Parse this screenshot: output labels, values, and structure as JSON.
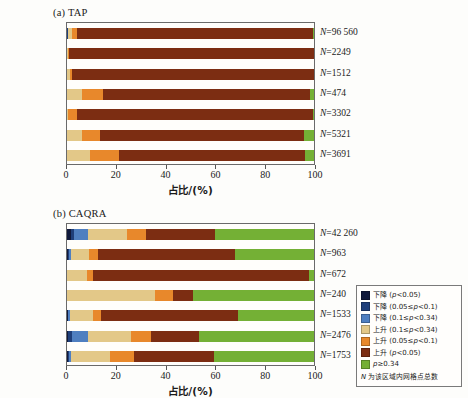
{
  "figure": {
    "axis_title": "占比/(%)",
    "xticks": [
      0,
      20,
      40,
      60,
      80,
      100
    ],
    "xlim": [
      0,
      100
    ]
  },
  "panel_a": {
    "title": "(a) TAP"
  },
  "panel_b": {
    "title": "(b) CAQRA"
  },
  "legend": {
    "items": [
      {
        "label": "下降 (p<0.05)",
        "color": "#10193b"
      },
      {
        "label": "下降 (0.05≤p<0.1)",
        "color": "#1f3f7a"
      },
      {
        "label": "下降 (0.1≤p<0.34)",
        "color": "#4f7fc0"
      },
      {
        "label": "上升 (0.1≤p<0.34)",
        "color": "#e3c888"
      },
      {
        "label": "上升 (0.05≤p<0.1)",
        "color": "#e8882b"
      },
      {
        "label": "上升 (p<0.05)",
        "color": "#7c2d12"
      },
      {
        "label": "p≥0.34",
        "color": "#74b035"
      }
    ],
    "note": "N 为该区域内网格点总数"
  },
  "chart_data": [
    {
      "type": "bar",
      "orientation": "horizontal",
      "stacked": true,
      "title": "(a) TAP",
      "xlabel": "占比/(%)",
      "ylabel": "",
      "xlim": [
        0,
        100
      ],
      "xticks": [
        0,
        20,
        40,
        60,
        80,
        100
      ],
      "grid": false,
      "legend_position": "right-outside-shared",
      "categories": [
        "全国",
        "京津冀",
        "汾渭平原",
        "珠三角",
        "长三角",
        "川渝地区",
        "两湖地区"
      ],
      "series": [
        {
          "name": "下降 (p<0.05)",
          "color": "#10193b",
          "values": [
            0.2,
            0.0,
            0.0,
            0.0,
            0.0,
            0.0,
            0.0
          ]
        },
        {
          "name": "下降 (0.05≤p<0.1)",
          "color": "#1f3f7a",
          "values": [
            0.1,
            0.0,
            0.0,
            0.0,
            0.0,
            0.0,
            0.0
          ]
        },
        {
          "name": "下降 (0.1≤p<0.34)",
          "color": "#4f7fc0",
          "values": [
            0.2,
            0.0,
            0.0,
            0.0,
            0.0,
            0.0,
            0.0
          ]
        },
        {
          "name": "上升 (0.1≤p<0.34)",
          "color": "#e3c888",
          "values": [
            1.5,
            0.4,
            1.2,
            6.0,
            0.6,
            6.0,
            9.5
          ]
        },
        {
          "name": "上升 (0.05≤p<0.1)",
          "color": "#e8882b",
          "values": [
            2.0,
            0.5,
            0.9,
            8.5,
            3.6,
            7.5,
            11.5
          ]
        },
        {
          "name": "上升 (p<0.05)",
          "color": "#7c2d12",
          "values": [
            95.7,
            99.1,
            97.9,
            84.0,
            95.4,
            82.5,
            75.5
          ]
        },
        {
          "name": "p≥0.34",
          "color": "#74b035",
          "values": [
            0.3,
            0.0,
            0.0,
            1.5,
            0.4,
            4.0,
            3.5
          ]
        }
      ],
      "row_annotations": [
        {
          "category": "全国",
          "text": "N=96 560",
          "N": 96560
        },
        {
          "category": "京津冀",
          "text": "N=2249",
          "N": 2249
        },
        {
          "category": "汾渭平原",
          "text": "N=1512",
          "N": 1512
        },
        {
          "category": "珠三角",
          "text": "N=474",
          "N": 474
        },
        {
          "category": "长三角",
          "text": "N=3302",
          "N": 3302
        },
        {
          "category": "川渝地区",
          "text": "N=5321",
          "N": 5321
        },
        {
          "category": "两湖地区",
          "text": "N=3691",
          "N": 3691
        }
      ]
    },
    {
      "type": "bar",
      "orientation": "horizontal",
      "stacked": true,
      "title": "(b) CAQRA",
      "xlabel": "占比/(%)",
      "ylabel": "",
      "xlim": [
        0,
        100
      ],
      "xticks": [
        0,
        20,
        40,
        60,
        80,
        100
      ],
      "grid": false,
      "legend_position": "right-outside-shared",
      "categories": [
        "全国",
        "京津冀",
        "汾渭平原",
        "珠三角",
        "长三角",
        "川渝地区",
        "两湖地区"
      ],
      "series": [
        {
          "name": "下降 (p<0.05)",
          "color": "#10193b",
          "values": [
            1.8,
            0.4,
            0.0,
            0.0,
            0.3,
            0.6,
            0.4
          ]
        },
        {
          "name": "下降 (0.05≤p<0.1)",
          "color": "#1f3f7a",
          "values": [
            1.2,
            0.3,
            0.0,
            0.0,
            0.2,
            1.4,
            0.3
          ]
        },
        {
          "name": "下降 (0.1≤p<0.34)",
          "color": "#4f7fc0",
          "values": [
            5.5,
            0.8,
            0.0,
            0.0,
            0.6,
            6.5,
            0.8
          ]
        },
        {
          "name": "上升 (0.1≤p<0.34)",
          "color": "#e3c888",
          "values": [
            16.0,
            7.5,
            8.0,
            35.5,
            9.5,
            17.5,
            16.0
          ]
        },
        {
          "name": "上升 (0.05≤p<0.1)",
          "color": "#e8882b",
          "values": [
            7.5,
            3.5,
            2.5,
            7.5,
            3.0,
            8.0,
            9.5
          ]
        },
        {
          "name": "上升 (p<0.05)",
          "color": "#7c2d12",
          "values": [
            28.0,
            55.5,
            87.5,
            8.0,
            55.5,
            19.5,
            32.5
          ]
        },
        {
          "name": "p≥0.34",
          "color": "#74b035",
          "values": [
            40.0,
            32.0,
            2.0,
            49.0,
            30.9,
            46.5,
            40.5
          ]
        }
      ],
      "row_annotations": [
        {
          "category": "全国",
          "text": "N=42 260",
          "N": 42260
        },
        {
          "category": "京津冀",
          "text": "N=963",
          "N": 963
        },
        {
          "category": "汾渭平原",
          "text": "N=672",
          "N": 672
        },
        {
          "category": "珠三角",
          "text": "N=240",
          "N": 240
        },
        {
          "category": "长三角",
          "text": "N=1533",
          "N": 1533
        },
        {
          "category": "川渝地区",
          "text": "N=2476",
          "N": 2476
        },
        {
          "category": "两湖地区",
          "text": "N=1753",
          "N": 1753
        }
      ]
    }
  ]
}
